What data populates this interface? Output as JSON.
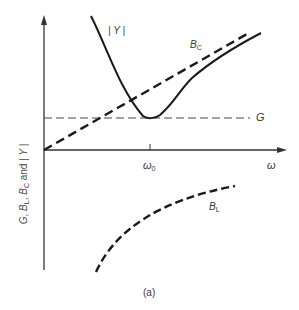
{
  "figure": {
    "caption": "(a)",
    "y_axis_label": {
      "parts": [
        "G",
        ", ",
        "B",
        "L",
        ", ",
        "B",
        "C",
        " and ",
        "| Y |"
      ]
    },
    "x_axis_label": "ω",
    "x_tick_label": "ω",
    "x_tick_sub": "0",
    "curve_labels": {
      "Y": "| Y |",
      "BC_main": "B",
      "BC_sub": "C",
      "G": "G",
      "BL_main": "B",
      "BL_sub": "L"
    }
  },
  "colors": {
    "ink": "#1a1a1a",
    "axis": "#333333",
    "label": "#3a3a3a"
  }
}
